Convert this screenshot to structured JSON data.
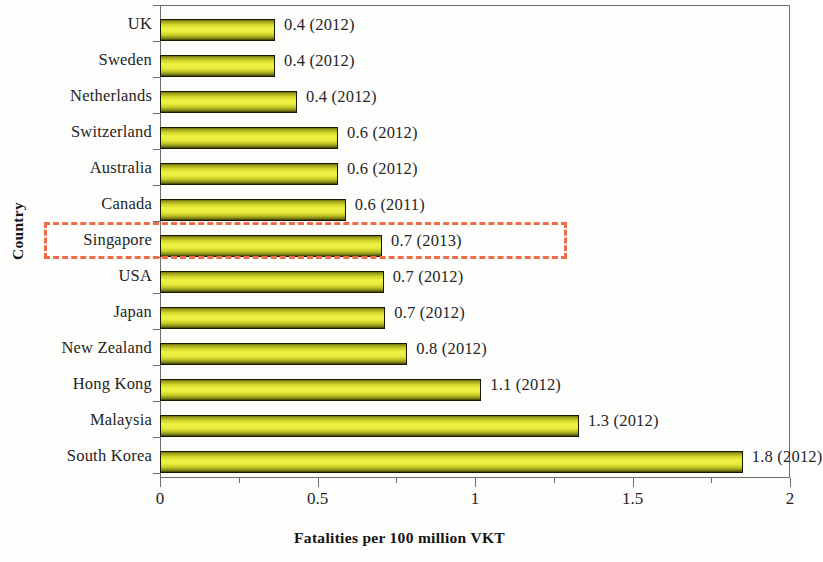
{
  "chart_data": {
    "type": "bar",
    "orientation": "horizontal",
    "title": "",
    "xlabel": "Fatalities per 100 million  VKT",
    "ylabel": "Country",
    "xlim": [
      0,
      2
    ],
    "ylim": null,
    "grid": false,
    "legend": null,
    "xticks": [
      "0",
      "0.5",
      "1",
      "1.5",
      "2"
    ],
    "xtick_values": [
      0,
      0.5,
      1,
      1.5,
      2
    ],
    "minor_xticks": [
      0.25,
      0.75,
      1.25,
      1.75
    ],
    "categories": [
      "UK",
      "Sweden",
      "Netherlands",
      "Switzerland",
      "Australia",
      "Canada",
      "Singapore",
      "USA",
      "Japan",
      "New Zealand",
      "Hong Kong",
      "Malaysia",
      "South Korea"
    ],
    "values": [
      0.365,
      0.365,
      0.435,
      0.565,
      0.565,
      0.59,
      0.705,
      0.71,
      0.715,
      0.785,
      1.02,
      1.33,
      1.85
    ],
    "data_labels": [
      "0.4 (2012)",
      "0.4 (2012)",
      "0.4 (2012)",
      "0.6 (2012)",
      "0.6 (2012)",
      "0.6 (2011)",
      "0.7 (2013)",
      "0.7 (2012)",
      "0.7 (2012)",
      "0.8 (2012)",
      "1.1 (2012)",
      "1.3 (2012)",
      "1.8 (2012)"
    ],
    "label_values": [
      0.4,
      0.4,
      0.4,
      0.6,
      0.6,
      0.6,
      0.7,
      0.7,
      0.7,
      0.8,
      1.1,
      1.3,
      1.8
    ],
    "label_years": [
      2012,
      2012,
      2012,
      2012,
      2012,
      2011,
      2013,
      2012,
      2012,
      2012,
      2012,
      2012,
      2012
    ],
    "bar_fill_color": "#e9ee3c",
    "bar_edge_color": "#171705",
    "highlight": {
      "category": "Singapore",
      "color": "#ef6b4a",
      "style": "dashed"
    }
  },
  "axes": {
    "x_title": "Fatalities per 100 million  VKT",
    "y_title": "Country"
  }
}
